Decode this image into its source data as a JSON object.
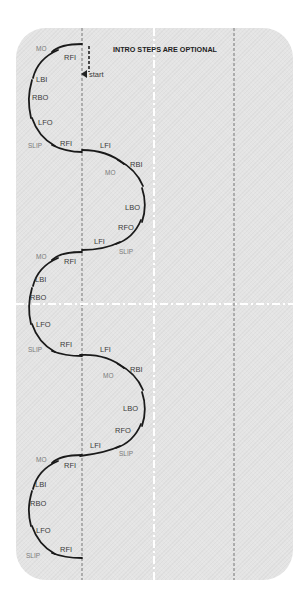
{
  "diagram": {
    "note": "INTRO STEPS ARE OPTIONAL",
    "start_label": "start",
    "colors": {
      "card": "#e4e4e4",
      "path": "#1a1a1a",
      "center_line": "#777777",
      "guide_line": "#ffffff"
    },
    "lobes": [
      {
        "side": "left",
        "labels": [
          "MO",
          "RFI",
          "LBI",
          "RBO",
          "LFO",
          "SLIP",
          "RFI"
        ]
      },
      {
        "side": "right",
        "labels": [
          "LFI",
          "MO",
          "RBI",
          "LBO",
          "RFO",
          "LFI",
          "SLIP"
        ]
      },
      {
        "side": "left",
        "labels": [
          "MO",
          "RFI",
          "LBI",
          "RBO",
          "LFO",
          "SLIP",
          "RFI"
        ]
      },
      {
        "side": "right",
        "labels": [
          "LFI",
          "MO",
          "RBI",
          "LBO",
          "RFO",
          "LFI",
          "SLIP"
        ]
      },
      {
        "side": "left",
        "labels": [
          "MO",
          "RFI",
          "LBI",
          "RBO",
          "LFO",
          "SLIP",
          "RFI"
        ]
      }
    ]
  }
}
